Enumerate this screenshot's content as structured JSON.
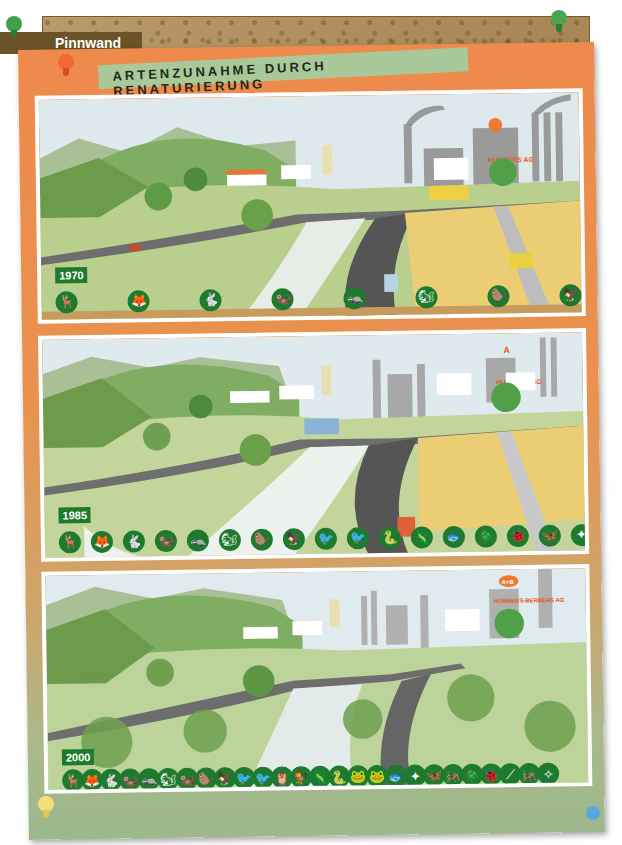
{
  "header": {
    "brand_label": "Pinnwand"
  },
  "poster": {
    "title": "ARTENZUNAHME DURCH RENATURIERUNG",
    "colors": {
      "paper": "#ee8a4c",
      "title_strip": "#a9c99b",
      "icon_badge": "#1d7a2e",
      "year_badge": "#1e7a2c",
      "cork": "#b99a6a"
    }
  },
  "panels": [
    {
      "year": "1970",
      "factory_sign": "HUBBERS AG",
      "factory_logo": "A",
      "species_count": 8,
      "species_icons": [
        "deer",
        "fox",
        "hare",
        "marten",
        "badger",
        "squirrel",
        "beaver",
        "bird-of-prey"
      ]
    },
    {
      "year": "1985",
      "factory_sign": "HUBBERS AG",
      "factory_logo": "A",
      "species_count": 17,
      "species_icons": [
        "deer",
        "fox",
        "hare",
        "marten",
        "badger",
        "squirrel",
        "beaver",
        "bird-of-prey",
        "heron",
        "heron",
        "partridge",
        "snake",
        "newt",
        "fish",
        "beetle",
        "bug",
        "butterfly",
        "dragonfly"
      ]
    },
    {
      "year": "2000",
      "factory_sign": "A+B HUBBERS-BERBERS AG",
      "factory_logo": "A+B",
      "species_count": 26,
      "species_icons": [
        "deer",
        "fox",
        "hare",
        "otter",
        "badger",
        "squirrel",
        "marten",
        "beaver",
        "bird-of-prey",
        "heron",
        "stork",
        "owl",
        "partridge",
        "lizard",
        "snake",
        "frog",
        "toad",
        "fish",
        "dragonfly",
        "butterfly",
        "grasshopper",
        "beetle",
        "bug",
        "stick-insect",
        "cricket",
        "mayfly"
      ]
    }
  ],
  "icon_glyphs": {
    "deer": "🦌",
    "fox": "🦊",
    "hare": "🐇",
    "marten": "🦦",
    "badger": "🦡",
    "squirrel": "🐿",
    "beaver": "🦫",
    "bird-of-prey": "🦅",
    "heron": "🐦",
    "stork": "🐦",
    "owl": "🦉",
    "partridge": "🐓",
    "snake": "🐍",
    "newt": "🦎",
    "lizard": "🦎",
    "frog": "🐸",
    "toad": "🐸",
    "fish": "🐟",
    "beetle": "🪲",
    "bug": "🐞",
    "butterfly": "🦋",
    "dragonfly": "✦",
    "grasshopper": "🦗",
    "stick-insect": "⟋",
    "cricket": "🦗",
    "mayfly": "✧",
    "otter": "🦦"
  }
}
